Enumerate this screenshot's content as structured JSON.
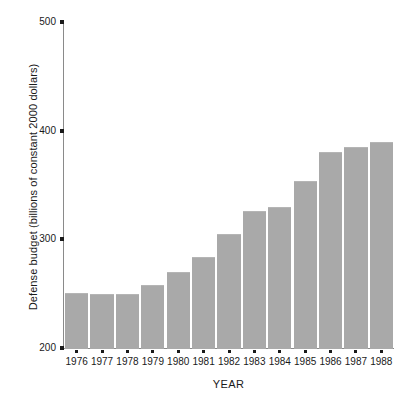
{
  "chart_data": {
    "type": "bar",
    "title": "",
    "xlabel": "YEAR",
    "ylabel": "Defense budget (billions of constant 2000 dollars)",
    "categories": [
      "1976",
      "1977",
      "1978",
      "1979",
      "1980",
      "1981",
      "1982",
      "1983",
      "1984",
      "1985",
      "1986",
      "1987",
      "1988"
    ],
    "values": [
      251,
      250,
      250,
      258,
      270,
      284,
      305,
      326,
      330,
      354,
      380,
      385,
      390
    ],
    "ylim": [
      200,
      500
    ],
    "yticks": [
      200,
      300,
      400,
      500
    ],
    "ytick_labels": [
      "200",
      "300",
      "400",
      "500"
    ],
    "grid": false,
    "legend": false,
    "bar_color": "#a9a9a9",
    "axis_color": "#8a8a8a",
    "text_color": "#1a1a1a",
    "background": "#ffffff"
  }
}
